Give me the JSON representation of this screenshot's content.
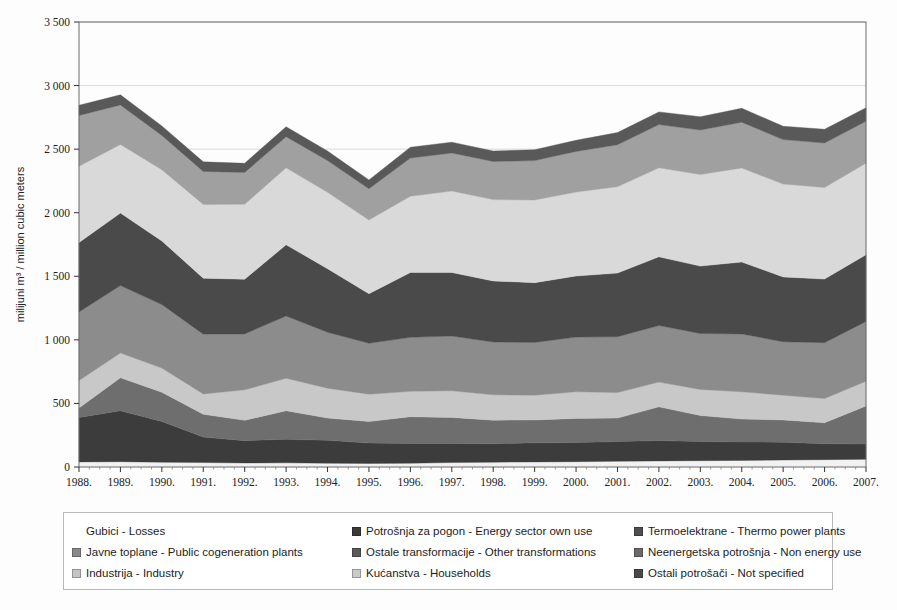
{
  "chart_data": {
    "type": "area",
    "stacked": true,
    "title": "",
    "subtitle": "",
    "xlabel": "",
    "ylabel": "milijuni m³ / million cubic meters",
    "ylim": [
      0,
      3500
    ],
    "ytick_values": [
      0,
      500,
      1000,
      1500,
      2000,
      2500,
      3000,
      3500
    ],
    "ytick_labels": [
      "0",
      "500",
      "1 000",
      "1 500",
      "2 000",
      "2 500",
      "3 000",
      "3 500"
    ],
    "grid": true,
    "legend_position": "bottom",
    "categories": [
      "1988.",
      "1989.",
      "1990.",
      "1991.",
      "1992.",
      "1993.",
      "1994.",
      "1995.",
      "1996.",
      "1997.",
      "1998.",
      "1999.",
      "2000.",
      "2001.",
      "2002.",
      "2003.",
      "2004.",
      "2005.",
      "2006.",
      "2007."
    ],
    "series": [
      {
        "name": "Potrošnja za pogon - Energy sector own use",
        "color": "#f2f2f2",
        "values": [
          40,
          42,
          38,
          35,
          32,
          33,
          30,
          28,
          30,
          35,
          38,
          40,
          42,
          45,
          48,
          50,
          52,
          55,
          58,
          60
        ]
      },
      {
        "name": "Termoelektrane - Thermo power plants",
        "color": "#3c3c3c",
        "values": [
          350,
          400,
          320,
          200,
          175,
          185,
          180,
          160,
          155,
          150,
          145,
          150,
          150,
          155,
          160,
          150,
          145,
          140,
          125,
          120
        ]
      },
      {
        "name": "Javne toplane - Public cogeneration plants",
        "color": "#6e6e6e",
        "values": [
          75,
          260,
          230,
          180,
          160,
          225,
          175,
          170,
          210,
          205,
          185,
          180,
          190,
          185,
          265,
          205,
          180,
          175,
          165,
          300
        ]
      },
      {
        "name": "Ostale transformacije - Other transformations",
        "color": "#c8c8c8",
        "values": [
          215,
          195,
          190,
          160,
          240,
          255,
          235,
          215,
          200,
          210,
          200,
          195,
          210,
          200,
          195,
          205,
          215,
          195,
          190,
          195
        ]
      },
      {
        "name": "Neenergetska potrošnja - Non energy use",
        "color": "#8c8c8c",
        "values": [
          540,
          530,
          500,
          470,
          440,
          490,
          440,
          400,
          425,
          430,
          415,
          415,
          430,
          440,
          445,
          440,
          455,
          420,
          440,
          470
        ]
      },
      {
        "name": "Industrija - Industry",
        "color": "#4a4a4a",
        "values": [
          545,
          570,
          500,
          440,
          430,
          560,
          500,
          390,
          510,
          500,
          480,
          470,
          480,
          500,
          540,
          530,
          565,
          510,
          500,
          525
        ]
      },
      {
        "name": "Kućanstva - Households",
        "color": "#d9d9d9",
        "values": [
          600,
          540,
          560,
          580,
          590,
          605,
          600,
          580,
          600,
          640,
          640,
          650,
          660,
          680,
          700,
          720,
          740,
          730,
          720,
          720
        ],
        "note": "largest band, light gray"
      },
      {
        "name": "Ostali potrošači - Not specified",
        "color": "#a0a0a0",
        "values": [
          400,
          310,
          270,
          260,
          250,
          245,
          250,
          245,
          300,
          300,
          300,
          310,
          320,
          330,
          340,
          350,
          360,
          350,
          350,
          330
        ]
      },
      {
        "name": "Gubici - Losses",
        "color": "#595959",
        "values": [
          80,
          80,
          75,
          75,
          72,
          78,
          75,
          70,
          85,
          85,
          82,
          85,
          88,
          95,
          100,
          105,
          110,
          105,
          108,
          105
        ]
      }
    ],
    "totals": [
      2845,
      2927,
      2683,
      2400,
      2389,
      2676,
      2485,
      2258,
      2515,
      2555,
      2485,
      2495,
      2570,
      2630,
      2793,
      2755,
      2822,
      2680,
      2656,
      2825
    ]
  },
  "legend": {
    "items": [
      {
        "label": "Gubici - Losses",
        "color": "#595959",
        "swatch": "blank",
        "row": 0,
        "col": 0
      },
      {
        "label": "Potrošnja za pogon - Energy sector own use",
        "color": "#3a3a3a",
        "swatch": "solid",
        "row": 0,
        "col": 1
      },
      {
        "label": "Termoelektrane - Thermo power plants",
        "color": "#4e4e4e",
        "swatch": "solid",
        "row": 0,
        "col": 2
      },
      {
        "label": "Javne toplane - Public cogeneration plants",
        "color": "#8a8a8a",
        "swatch": "solid",
        "row": 1,
        "col": 0
      },
      {
        "label": "Ostale transformacije - Other transformations",
        "color": "#5a5a5a",
        "swatch": "solid",
        "row": 1,
        "col": 1
      },
      {
        "label": "Neenergetska potrošnja - Non energy use",
        "color": "#6b6b6b",
        "swatch": "solid",
        "row": 1,
        "col": 2
      },
      {
        "label": "Industrija - Industry",
        "color": "#c4c4c4",
        "swatch": "solid",
        "row": 2,
        "col": 0
      },
      {
        "label": "Kućanstva - Households",
        "color": "#c9c9c9",
        "swatch": "solid",
        "row": 2,
        "col": 1
      },
      {
        "label": "Ostali potrošači - Not specified",
        "color": "#4a4a4a",
        "swatch": "solid",
        "row": 2,
        "col": 2
      }
    ]
  },
  "style": {
    "plot_border": "#6a6a6a",
    "gridline": "#d0d0d0",
    "background": "#ffffff"
  }
}
